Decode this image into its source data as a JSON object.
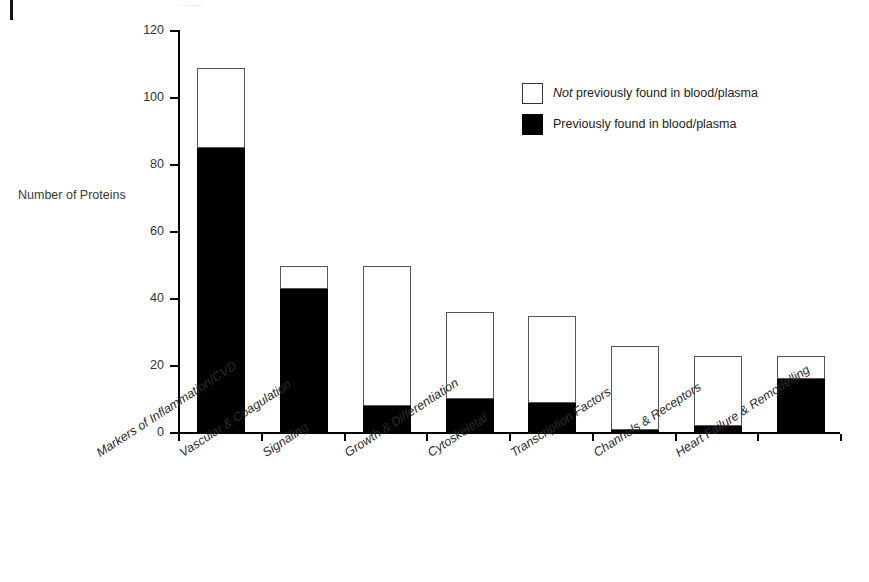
{
  "page": {
    "margin_mark": "page-edge-mark",
    "cropped_caption": "........"
  },
  "chart_data": {
    "type": "bar",
    "title": "",
    "xlabel": "",
    "ylabel": "Number of Proteins",
    "ylim": [
      0,
      120
    ],
    "yticks": [
      0,
      20,
      40,
      60,
      80,
      100,
      120
    ],
    "grid": false,
    "stacked": true,
    "legend_position": "upper-right-inside",
    "categories": [
      "Markers of Inflammation/CVD",
      "Vascular & Coagulation",
      "Signaling",
      "Growth & Differentiation",
      "Cytoskeletal",
      "Transcription Factors",
      "Channels & Receptors",
      "Heart Failure & Remodelling"
    ],
    "totals": [
      109,
      50,
      50,
      36,
      35,
      26,
      23,
      23
    ],
    "series": [
      {
        "name": "Previously found in blood/plasma",
        "color": "#000000",
        "values": [
          85,
          43,
          8,
          10,
          9,
          1,
          2,
          16
        ]
      },
      {
        "name": "Not previously found in blood/plasma",
        "color": "#ffffff",
        "values": [
          24,
          7,
          42,
          26,
          26,
          25,
          21,
          7
        ]
      }
    ]
  },
  "legend": {
    "items": [
      {
        "swatch": "open",
        "emphasis": "Not",
        "text": " previously found in blood/plasma"
      },
      {
        "swatch": "filled",
        "emphasis": "",
        "text": "Previously found in blood/plasma"
      }
    ]
  }
}
